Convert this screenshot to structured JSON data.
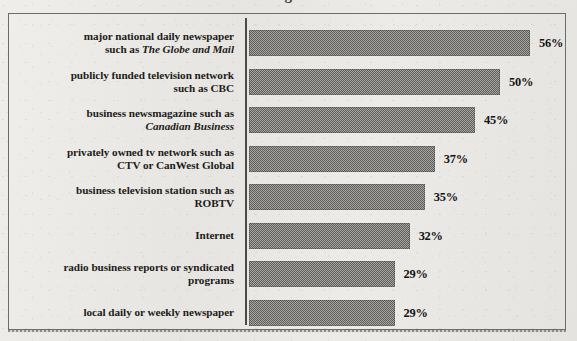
{
  "title_fragment": "g",
  "chart_data": {
    "type": "bar",
    "orientation": "horizontal",
    "title": "",
    "xlabel": "",
    "ylabel": "",
    "xlim": [
      0,
      60
    ],
    "grid": false,
    "legend": null,
    "value_suffix": "%",
    "categories": [
      "major national daily newspaper such as The Globe and Mail",
      "publicly funded television network such as CBC",
      "business newsmagazine such as Canadian Business",
      "privately owned tv network such as CTV or CanWest Global",
      "business television station such as ROBTV",
      "Internet",
      "radio business reports or syndicated programs",
      "local daily or weekly newspaper"
    ],
    "values": [
      56,
      50,
      45,
      37,
      35,
      32,
      29,
      29
    ],
    "value_labels": [
      "56%",
      "50%",
      "45%",
      "37%",
      "35%",
      "32%",
      "29%",
      "29%"
    ]
  },
  "rows": [
    {
      "line1_pre": "major national daily newspaper",
      "line1_it": "",
      "line2_pre": "such as ",
      "line2_it": "The Globe and Mail",
      "value": 56,
      "value_label": "56%"
    },
    {
      "line1_pre": "publicly funded television network",
      "line1_it": "",
      "line2_pre": "such as CBC",
      "line2_it": "",
      "value": 50,
      "value_label": "50%"
    },
    {
      "line1_pre": "business newsmagazine such as",
      "line1_it": "",
      "line2_pre": "",
      "line2_it": "Canadian Business",
      "value": 45,
      "value_label": "45%"
    },
    {
      "line1_pre": "privately owned tv network such as",
      "line1_it": "",
      "line2_pre": "CTV or CanWest Global",
      "line2_it": "",
      "value": 37,
      "value_label": "37%"
    },
    {
      "line1_pre": "business television station such as",
      "line1_it": "",
      "line2_pre": "ROBTV",
      "line2_it": "",
      "value": 35,
      "value_label": "35%"
    },
    {
      "line1_pre": "Internet",
      "line1_it": "",
      "line2_pre": "",
      "line2_it": "",
      "value": 32,
      "value_label": "32%"
    },
    {
      "line1_pre": "radio business reports or syndicated",
      "line1_it": "",
      "line2_pre": "programs",
      "line2_it": "",
      "value": 29,
      "value_label": "29%"
    },
    {
      "line1_pre": "local daily or weekly newspaper",
      "line1_it": "",
      "line2_pre": "",
      "line2_it": "",
      "value": 29,
      "value_label": "29%"
    }
  ],
  "geometry": {
    "row_top_start": 14,
    "row_pitch": 38.5,
    "px_per_unit": 5.02,
    "bar_gap_label": 9
  },
  "colors": {
    "bar": "#7e7c79",
    "text": "#1d1c1a",
    "frame": "#6e6c68",
    "paper": "#eae8e4"
  }
}
